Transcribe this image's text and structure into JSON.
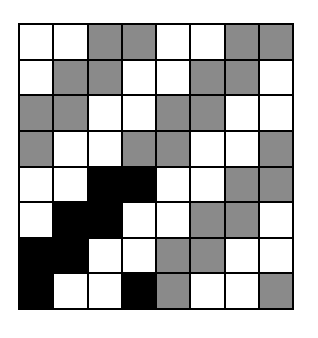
{
  "title": "",
  "grid": {
    "rows": 8,
    "cols": 8,
    "colors": {
      "w": "#ffffff",
      "g": "#8a8a8a",
      "b": "#000000"
    },
    "cells": [
      [
        "w",
        "w",
        "g",
        "g",
        "w",
        "w",
        "g",
        "g"
      ],
      [
        "w",
        "g",
        "g",
        "w",
        "w",
        "g",
        "g",
        "w"
      ],
      [
        "g",
        "g",
        "w",
        "w",
        "g",
        "g",
        "w",
        "w"
      ],
      [
        "g",
        "w",
        "w",
        "g",
        "g",
        "w",
        "w",
        "g"
      ],
      [
        "w",
        "w",
        "b",
        "b",
        "w",
        "w",
        "g",
        "g"
      ],
      [
        "w",
        "b",
        "b",
        "w",
        "w",
        "g",
        "g",
        "w"
      ],
      [
        "b",
        "b",
        "w",
        "w",
        "g",
        "g",
        "w",
        "w"
      ],
      [
        "b",
        "w",
        "w",
        "b",
        "g",
        "w",
        "w",
        "g"
      ]
    ]
  }
}
